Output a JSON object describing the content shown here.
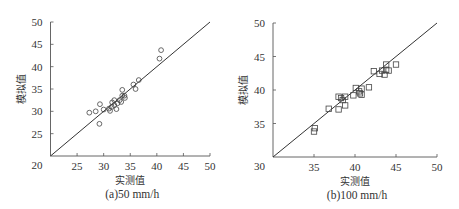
{
  "chart_data": [
    {
      "type": "scatter",
      "caption": "(a)50 mm/h",
      "xlabel": "实测值",
      "ylabel": "模拟值",
      "xlim": [
        20,
        50
      ],
      "ylim": [
        20,
        50
      ],
      "xticks": [
        25,
        30,
        35,
        40,
        45,
        50
      ],
      "yticks": [
        20,
        25,
        30,
        35,
        40,
        45,
        50
      ],
      "origin_label": "20",
      "marker": "circle",
      "reference_line": "y = x",
      "grid": false,
      "points": [
        [
          27.3,
          29.7
        ],
        [
          28.5,
          30.0
        ],
        [
          29.3,
          31.6
        ],
        [
          29.2,
          27.2
        ],
        [
          30.0,
          30.4
        ],
        [
          31.0,
          30.6
        ],
        [
          31.2,
          30.1
        ],
        [
          31.5,
          31.0
        ],
        [
          31.6,
          32.0
        ],
        [
          32.0,
          32.5
        ],
        [
          32.0,
          31.4
        ],
        [
          32.4,
          30.5
        ],
        [
          32.6,
          31.8
        ],
        [
          33.0,
          32.5
        ],
        [
          33.3,
          32.1
        ],
        [
          33.5,
          34.8
        ],
        [
          33.5,
          33.5
        ],
        [
          33.9,
          33.5
        ],
        [
          34.0,
          33.0
        ],
        [
          35.6,
          36.0
        ],
        [
          36.0,
          35.0
        ],
        [
          36.6,
          37.0
        ],
        [
          40.5,
          41.8
        ],
        [
          40.8,
          43.7
        ]
      ]
    },
    {
      "type": "scatter",
      "caption": "(b)100 mm/h",
      "xlabel": "实测值",
      "ylabel": "模拟值",
      "xlim": [
        30,
        50
      ],
      "ylim": [
        30,
        50
      ],
      "xticks": [
        35,
        40,
        45,
        50
      ],
      "yticks": [
        30,
        35,
        40,
        45,
        50
      ],
      "origin_label": "30",
      "marker": "square",
      "reference_line": "y = x",
      "grid": false,
      "points": [
        [
          35.1,
          34.3
        ],
        [
          35.0,
          33.8
        ],
        [
          36.8,
          37.2
        ],
        [
          38.0,
          37.1
        ],
        [
          38.0,
          39.0
        ],
        [
          38.3,
          38.8
        ],
        [
          38.5,
          38.5
        ],
        [
          38.8,
          39.0
        ],
        [
          38.8,
          37.7
        ],
        [
          39.8,
          39.2
        ],
        [
          40.1,
          40.3
        ],
        [
          40.5,
          39.8
        ],
        [
          40.6,
          39.5
        ],
        [
          40.8,
          39.3
        ],
        [
          40.8,
          40.2
        ],
        [
          41.7,
          40.4
        ],
        [
          42.3,
          42.8
        ],
        [
          43.0,
          42.4
        ],
        [
          43.3,
          42.9
        ],
        [
          43.6,
          42.3
        ],
        [
          43.8,
          43.0
        ],
        [
          43.8,
          43.8
        ],
        [
          44.1,
          42.9
        ],
        [
          45.0,
          43.8
        ]
      ]
    }
  ]
}
